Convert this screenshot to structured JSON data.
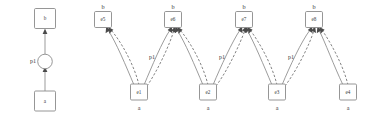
{
  "diagram": {
    "panels": [
      {
        "id": "left-panel",
        "name": "simple-pattern-graph",
        "nodes": [
          {
            "id": "top",
            "label": "b",
            "shape": "box",
            "x": 45,
            "y": 19
          },
          {
            "id": "place",
            "label": "",
            "shape": "circle",
            "x": 45,
            "y": 61
          },
          {
            "id": "bottom",
            "label": "a",
            "shape": "box",
            "x": 45,
            "y": 101
          }
        ],
        "edge_label": "p1",
        "edge_label_x": 33,
        "edge_label_y": 62
      },
      {
        "id": "right-panel",
        "name": "expanded-instance-graph",
        "bottom_nodes": [
          {
            "id": "e1",
            "label": "e1",
            "type": "a",
            "x": 139,
            "y": 92
          },
          {
            "id": "e2",
            "label": "e2",
            "type": "a",
            "x": 208,
            "y": 92
          },
          {
            "id": "e3",
            "label": "e3",
            "type": "a",
            "x": 277,
            "y": 92
          },
          {
            "id": "e4",
            "label": "e4",
            "type": "a",
            "x": 348,
            "y": 92
          }
        ],
        "top_nodes": [
          {
            "id": "e5",
            "label": "e5",
            "type": "b",
            "x": 103,
            "y": 20
          },
          {
            "id": "e6",
            "label": "e6",
            "type": "b",
            "x": 173,
            "y": 20
          },
          {
            "id": "e7",
            "label": "e7",
            "type": "b",
            "x": 244,
            "y": 20
          },
          {
            "id": "e8",
            "label": "e8",
            "type": "b",
            "x": 314,
            "y": 20
          }
        ],
        "edge_labels": [
          {
            "text": "p1",
            "x": 152,
            "y": 57
          },
          {
            "text": "p1",
            "x": 222,
            "y": 57
          },
          {
            "text": "p1",
            "x": 290,
            "y": 57
          },
          {
            "text": "p1",
            "x": 196,
            "y": 57
          }
        ],
        "edges": [
          {
            "from": "e1",
            "to": "e5",
            "style": "solid"
          },
          {
            "from": "e1",
            "to": "e5",
            "style": "dashed"
          },
          {
            "from": "e1",
            "to": "e6",
            "style": "solid"
          },
          {
            "from": "e1",
            "to": "e6",
            "style": "dashed"
          },
          {
            "from": "e2",
            "to": "e6",
            "style": "solid"
          },
          {
            "from": "e2",
            "to": "e6",
            "style": "dashed"
          },
          {
            "from": "e2",
            "to": "e7",
            "style": "solid"
          },
          {
            "from": "e2",
            "to": "e7",
            "style": "dashed"
          },
          {
            "from": "e3",
            "to": "e7",
            "style": "solid"
          },
          {
            "from": "e3",
            "to": "e7",
            "style": "dashed"
          },
          {
            "from": "e3",
            "to": "e8",
            "style": "solid"
          },
          {
            "from": "e3",
            "to": "e8",
            "style": "dashed"
          },
          {
            "from": "e4",
            "to": "e8",
            "style": "solid"
          },
          {
            "from": "e4",
            "to": "e8",
            "style": "dashed"
          }
        ]
      }
    ],
    "colors": {
      "node_stroke": "#8a8a8a",
      "edge_stroke": "#8a8a8a",
      "dashed_stroke": "#6e6e6e",
      "text": "#3a3a3a",
      "background": "#ffffff"
    }
  }
}
